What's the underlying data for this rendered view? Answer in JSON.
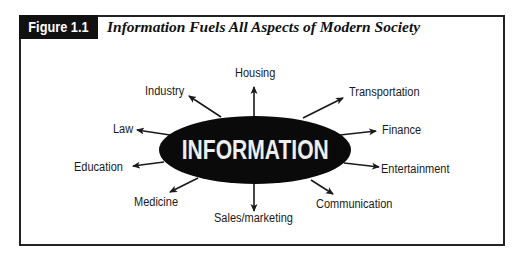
{
  "figure": {
    "label": "Figure 1.1",
    "title": "Information Fuels All Aspects of Modern Society"
  },
  "diagram": {
    "center": "INFORMATION",
    "nodes": [
      {
        "id": "housing",
        "label": "Housing"
      },
      {
        "id": "industry",
        "label": "Industry"
      },
      {
        "id": "transportation",
        "label": "Transportation"
      },
      {
        "id": "law",
        "label": "Law"
      },
      {
        "id": "finance",
        "label": "Finance"
      },
      {
        "id": "education",
        "label": "Education"
      },
      {
        "id": "entertainment",
        "label": "Entertainment"
      },
      {
        "id": "medicine",
        "label": "Medicine"
      },
      {
        "id": "communication",
        "label": "Communication"
      },
      {
        "id": "sales_marketing",
        "label": "Sales/marketing"
      }
    ],
    "colors": {
      "ellipse_fill": "#0a0a0a",
      "center_text": "#eeeeee",
      "arrow": "#1a1a1a",
      "border": "#222222"
    }
  }
}
